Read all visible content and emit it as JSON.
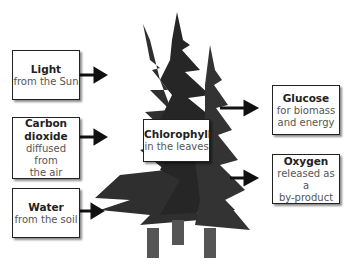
{
  "inputs": [
    {
      "title": "Light",
      "sub": "from the Sun"
    },
    {
      "title": "Carbon dioxide",
      "title_lines": [
        "Carbon",
        "dioxide"
      ],
      "sub_lines": [
        "diffused from",
        "the air"
      ]
    },
    {
      "title": "Water",
      "sub": "from the soil"
    }
  ],
  "center": {
    "title": "Chlorophyll",
    "sub": "in the leaves"
  },
  "outputs": [
    {
      "title": "Glucose",
      "sub_lines": [
        "for biomass",
        "and energy"
      ]
    },
    {
      "title": "Oxygen",
      "sub_lines": [
        "released as a",
        "by-product"
      ]
    }
  ],
  "colors": {
    "tree": "#2a2a2a",
    "trunk": "#555555",
    "border": "#222222",
    "arrow": "#111111"
  }
}
